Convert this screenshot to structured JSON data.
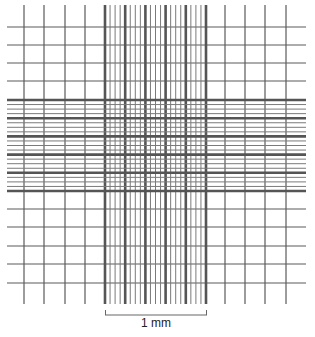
{
  "diagram": {
    "line_color": "#5a5a5a",
    "thick_line_color": "#555555",
    "grid": {
      "outer_vertical_x": [
        24,
        44,
        65,
        85,
        225,
        245,
        265,
        286
      ],
      "outer_horizontal_y": [
        27,
        45,
        63,
        81,
        209,
        227,
        246,
        264,
        283
      ],
      "center_x_range": [
        105,
        206
      ],
      "center_y_range": [
        100,
        191
      ],
      "center_major_divisions": 5,
      "center_minor_per_major": 4,
      "horizontal_extent_x": [
        7,
        306
      ],
      "vertical_extent_y": [
        5,
        304
      ]
    },
    "scale_bar": {
      "label": "1 mm",
      "x_start": 105,
      "x_end": 207,
      "y": 315
    }
  }
}
